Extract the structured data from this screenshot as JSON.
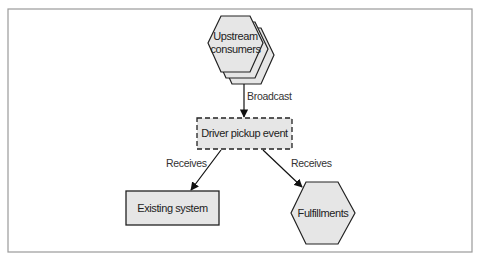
{
  "diagram": {
    "nodes": {
      "upstream": {
        "label_line1": "Upstream",
        "label_line2": "consumers",
        "shape": "stacked-hexagon"
      },
      "event": {
        "label": "Driver pickup event",
        "shape": "dashed-rectangle"
      },
      "existing": {
        "label": "Existing system",
        "shape": "rectangle"
      },
      "fulfillments": {
        "label": "Fulfillments",
        "shape": "hexagon"
      }
    },
    "edges": {
      "broadcast": {
        "label": "Broadcast",
        "from": "upstream",
        "to": "event"
      },
      "receives_left": {
        "label": "Receives",
        "from": "event",
        "to": "existing"
      },
      "receives_right": {
        "label": "Receives",
        "from": "event",
        "to": "fulfillments"
      }
    },
    "colors": {
      "node_fill": "#e6e6e6",
      "stroke": "#222222",
      "frame": "#9a9a9a"
    }
  }
}
